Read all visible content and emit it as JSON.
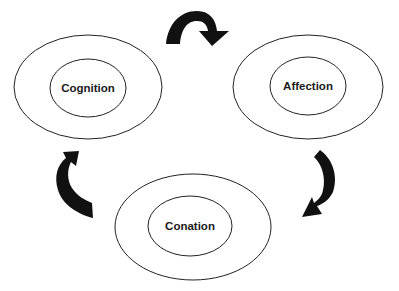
{
  "diagram": {
    "nodes": [
      {
        "id": "cognition",
        "label": "Cognition"
      },
      {
        "id": "affection",
        "label": "Affection"
      },
      {
        "id": "conation",
        "label": "Conation"
      }
    ],
    "edges": [
      {
        "from": "cognition",
        "to": "affection",
        "style": "curved-arrow"
      },
      {
        "from": "affection",
        "to": "conation",
        "style": "curved-arrow"
      },
      {
        "from": "conation",
        "to": "cognition",
        "style": "curved-arrow"
      }
    ],
    "colors": {
      "stroke": "#222222",
      "arrow": "#111111",
      "background": "#ffffff"
    }
  }
}
